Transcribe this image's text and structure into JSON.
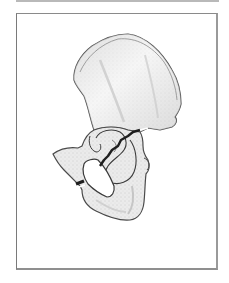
{
  "figure": {
    "colors": {
      "frame_border": "#8a8a8a",
      "top_rule": "#b9b9b9",
      "bone_fill": "#ebebeb",
      "bone_shade": "#d2d2d2",
      "bone_outline": "#4a4a4a",
      "fracture": "#1e1e1e",
      "background": "#ffffff"
    },
    "parts": {
      "ilium": "ilium",
      "acetabulum": "acetabulum",
      "pubis": "pubis",
      "ischium": "ischium",
      "obturator_foramen": "obturator foramen",
      "acetabular_fracture": "acetabular fracture line",
      "pubic_ramus_fracture": "pubic ramus fracture"
    }
  }
}
